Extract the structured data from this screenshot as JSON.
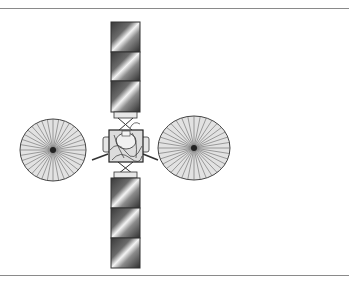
{
  "figure": {
    "components": [
      {
        "name": "solar-panel-upper",
        "segments": 3
      },
      {
        "name": "solar-panel-lower",
        "segments": 3
      },
      {
        "name": "satellite-bus"
      },
      {
        "name": "dish-antenna-left",
        "ribs": 36
      },
      {
        "name": "dish-antenna-right",
        "ribs": 36
      }
    ]
  },
  "colors": {
    "rule": "#8a8a8a",
    "outline": "#333333",
    "dish_fill": "#e2e2e2",
    "panel_dark": "#4a4a4a",
    "panel_light": "#f2f2f2"
  }
}
